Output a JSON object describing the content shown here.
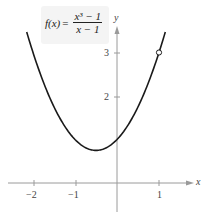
{
  "formula": {
    "lhs": "f(x)",
    "equals": "=",
    "numerator": "x³ − 1",
    "denominator": "x − 1"
  },
  "axes": {
    "x_label": "x",
    "y_label": "y",
    "x_ticks": [
      "−2",
      "−1",
      "1"
    ],
    "y_ticks": [
      "2",
      "3"
    ]
  },
  "chart_data": {
    "type": "line",
    "xlabel": "x",
    "ylabel": "y",
    "xlim": [
      -2.5,
      1.6
    ],
    "ylim": [
      -0.7,
      3.8
    ],
    "x_ticks": [
      -2,
      -1,
      1
    ],
    "y_ticks": [
      2,
      3
    ],
    "grid": false,
    "series": [
      {
        "name": "f(x) = x^2 + x + 1 (x ≠ 1)",
        "x": [
          -2.15,
          -2,
          -1.5,
          -1,
          -0.5,
          0,
          0.5,
          1,
          1.15
        ],
        "y": [
          3.47,
          3,
          1.75,
          1,
          0.75,
          1,
          1.75,
          3,
          3.47
        ]
      }
    ],
    "annotations": [
      {
        "type": "open-circle",
        "x": 1,
        "y": 3,
        "text": "hole at (1, 3)"
      }
    ],
    "colors": {
      "curve": "#1a1a1a",
      "axes": "#8a8a8a",
      "label_box": "#f4f4f4"
    }
  }
}
